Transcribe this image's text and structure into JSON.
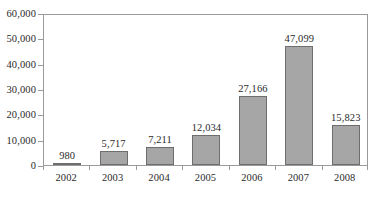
{
  "chart_data": {
    "type": "bar",
    "title": "",
    "subtitle": "",
    "xlabel": "",
    "ylabel": "",
    "categories": [
      "2002",
      "2003",
      "2004",
      "2005",
      "2006",
      "2007",
      "2008"
    ],
    "values": [
      980,
      5717,
      7211,
      12034,
      27166,
      47099,
      15823
    ],
    "value_labels": [
      "980",
      "5,717",
      "7,211",
      "12,034",
      "27,166",
      "47,099",
      "15,823"
    ],
    "ylim": [
      0,
      60000
    ],
    "ytick_values": [
      0,
      10000,
      20000,
      30000,
      40000,
      50000,
      60000
    ],
    "ytick_labels": [
      "0",
      "10,000",
      "20,000",
      "30,000",
      "40,000",
      "50,000",
      "60,000"
    ],
    "grid": false,
    "legend": false,
    "legend_position": "none",
    "bar_color": "#a6a6a6",
    "bar_border_color": "#6e6e6e",
    "axis_color": "#9a9a9a",
    "text_color": "#2b2b2b"
  }
}
